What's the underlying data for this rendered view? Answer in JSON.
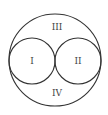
{
  "diagram": {
    "type": "venn-like region diagram",
    "outer_circle": {
      "cx": 55,
      "cy": 60,
      "r": 46
    },
    "inner_circles": [
      {
        "cx": 32,
        "cy": 61,
        "r": 23
      },
      {
        "cx": 78,
        "cy": 61,
        "r": 23
      }
    ],
    "stroke_color": "#333333",
    "regions": [
      {
        "label": "I",
        "x": 32,
        "y": 64
      },
      {
        "label": "II",
        "x": 78,
        "y": 64
      },
      {
        "label": "III",
        "x": 57,
        "y": 30
      },
      {
        "label": "IV",
        "x": 57,
        "y": 96
      }
    ]
  }
}
